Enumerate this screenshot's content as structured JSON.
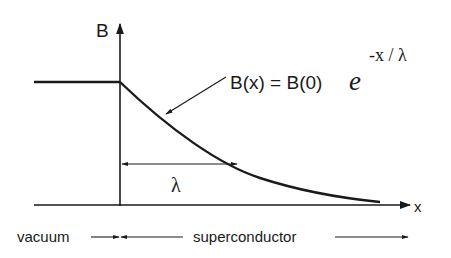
{
  "diagram": {
    "type": "london-penetration-depth",
    "axes": {
      "y_label": "B",
      "x_label": "x"
    },
    "equation": {
      "lhs": "B(x) = B(0)",
      "base": "e",
      "exponent": "-x / λ"
    },
    "penetration_depth_label": "λ",
    "regions": {
      "left": "vacuum",
      "right": "superconductor"
    },
    "colors": {
      "ink": "#1a1a1a",
      "background": "#ffffff"
    }
  }
}
